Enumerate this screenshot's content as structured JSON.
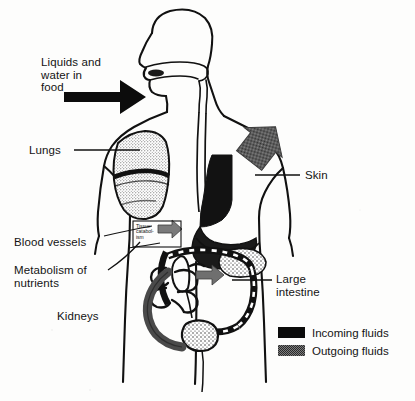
{
  "figure": {
    "type": "anatomical-diagram"
  },
  "labels": {
    "liquids": "Liquids and\nwater in\nfood",
    "lungs": "Lungs",
    "blood_vessels": "Blood vessels",
    "metabolism": "Metabolism of\nnutrients",
    "kidneys": "Kidneys",
    "skin": "Skin",
    "large_intestine": "Large\nintestine",
    "tissue_catabolism": "Tissue\ncatabol-\nism"
  },
  "legend": {
    "items": [
      {
        "label": "Incoming fluids",
        "swatch": "solid-black",
        "color": "#0b0b0b"
      },
      {
        "label": "Outgoing fluids",
        "swatch": "dithered-gray",
        "color": "#7d7d7d"
      }
    ]
  },
  "caption": {
    "text": ""
  },
  "colors": {
    "ink": "#141414",
    "incoming": "#0b0b0b",
    "outgoing": "#7d7d7d",
    "background": "#fdfdfc"
  }
}
